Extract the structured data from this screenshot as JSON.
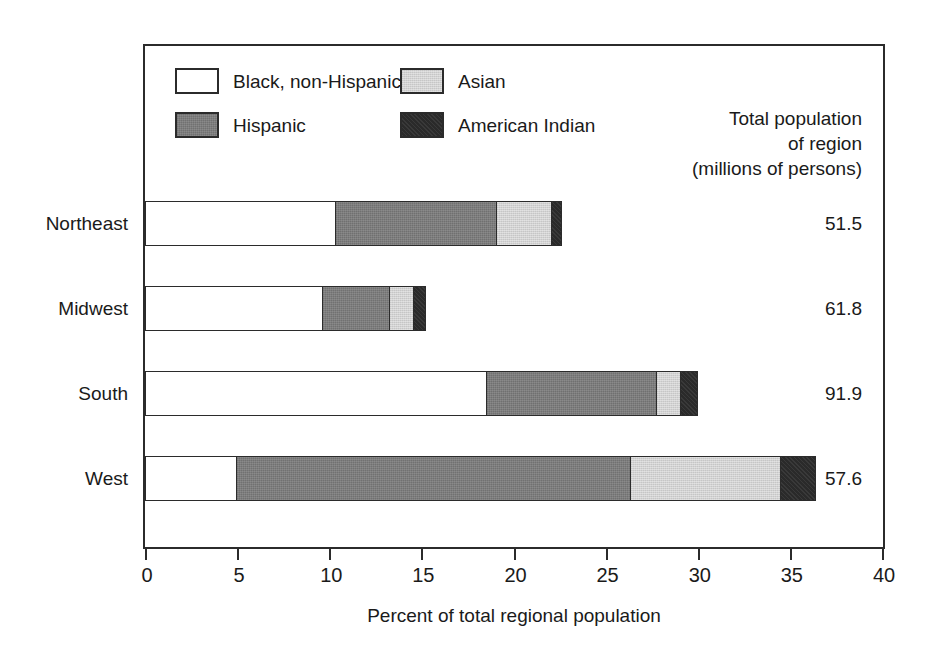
{
  "chart_data": {
    "type": "bar",
    "orientation": "horizontal",
    "stacked": true,
    "title": "",
    "xlabel": "Percent of total regional population",
    "ylabel": "",
    "xlim": [
      0,
      40
    ],
    "xticks": [
      0,
      5,
      10,
      15,
      20,
      25,
      30,
      35,
      40
    ],
    "xtick_labels": [
      "0",
      "5",
      "10",
      "15",
      "20",
      "25",
      "30",
      "35",
      "40"
    ],
    "grid": false,
    "legend_position": "top-left-inside",
    "categories": [
      "Northeast",
      "Midwest",
      "South",
      "West"
    ],
    "series": [
      {
        "name": "Black, non-Hispanic",
        "color": "#ffffff",
        "values": [
          10.4,
          9.7,
          18.6,
          5.0
        ]
      },
      {
        "name": "Hispanic",
        "color": "#7d7d7d",
        "values": [
          8.8,
          3.7,
          9.3,
          21.5
        ]
      },
      {
        "name": "Asian",
        "color": "#d2d2d2",
        "values": [
          3.1,
          1.4,
          1.4,
          8.2
        ]
      },
      {
        "name": "American Indian",
        "color": "#2a2a2a",
        "values": [
          0.6,
          0.7,
          1.0,
          2.0
        ]
      }
    ],
    "totals_percent": [
      22.9,
      15.5,
      30.3,
      36.7
    ],
    "annotations": {
      "right_column_header": [
        "Total population",
        "of region",
        "(millions of persons)"
      ],
      "right_column_values": [
        "51.5",
        "61.8",
        "91.9",
        "57.6"
      ]
    }
  },
  "legend": {
    "entries": [
      {
        "label": "Black, non-Hispanic",
        "swatch": "fill-black-nh"
      },
      {
        "label": "Asian",
        "swatch": "fill-asian"
      },
      {
        "label": "Hispanic",
        "swatch": "fill-hispanic"
      },
      {
        "label": "American Indian",
        "swatch": "fill-american-indian"
      }
    ]
  },
  "right_header": {
    "line1": "Total population",
    "line2": "of region",
    "line3": "(millions of persons)"
  },
  "rows": [
    {
      "category": "Northeast",
      "total": "51.5"
    },
    {
      "category": "Midwest",
      "total": "61.8"
    },
    {
      "category": "South",
      "total": "91.9"
    },
    {
      "category": "West",
      "total": "57.6"
    }
  ],
  "axis": {
    "title": "Percent of total regional population",
    "ticks": [
      "0",
      "5",
      "10",
      "15",
      "20",
      "25",
      "30",
      "35",
      "40"
    ]
  }
}
